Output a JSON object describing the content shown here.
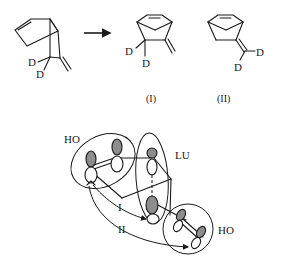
{
  "reaction": {
    "arrow": "→",
    "reactant": {
      "description": "bicyclic diene with CD2 and exocyclic methylene",
      "labels": [
        "D",
        "D"
      ]
    },
    "products": [
      {
        "label": "(I)",
        "atom_labels": [
          "D",
          "D"
        ]
      },
      {
        "label": "(II)",
        "atom_labels": [
          "D",
          "D"
        ]
      }
    ]
  },
  "orbital_diagram": {
    "labels": {
      "homo_top": "HO",
      "lumo": "LU",
      "homo_bottom": "HO",
      "path_one": "I",
      "path_two": "II"
    }
  }
}
